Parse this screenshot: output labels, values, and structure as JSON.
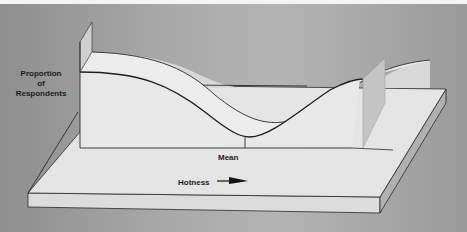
{
  "diagram": {
    "type": "3d-distribution-illustration",
    "y_axis_label": [
      "Proportion",
      "of",
      "Respondents"
    ],
    "x_axis_marker": "Mean",
    "x_axis_direction_label": "Hotness",
    "direction_icon": "arrow-right-icon",
    "curve_shape": "bimodal (U-shaped) — high at both extremes, minimum at the mean",
    "colors": {
      "background": "#a4a4a4",
      "surface": "#e6e6e6",
      "side": "#c8c8c8",
      "line": "#2a2a2a"
    }
  }
}
